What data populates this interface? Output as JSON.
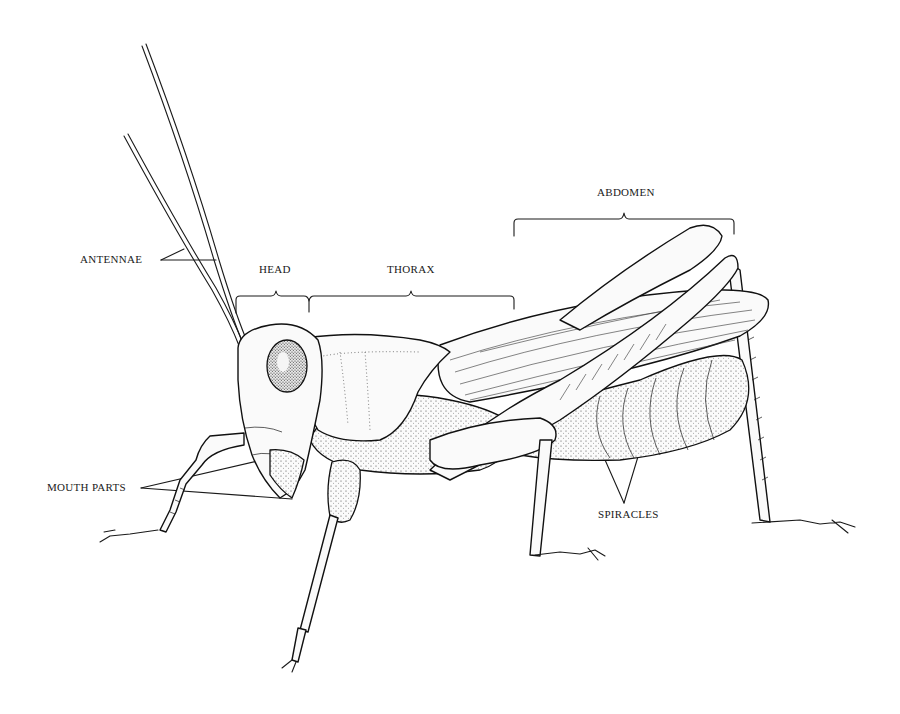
{
  "figure": {
    "labels": {
      "antennae": "ANTENNAE",
      "head": "HEAD",
      "thorax": "THORAX",
      "abdomen": "ABDOMEN",
      "mouth_parts": "MOUTH PARTS",
      "spiracles": "SPIRACLES"
    },
    "colors": {
      "ink": "#1a1a1a",
      "background": "#ffffff"
    }
  }
}
